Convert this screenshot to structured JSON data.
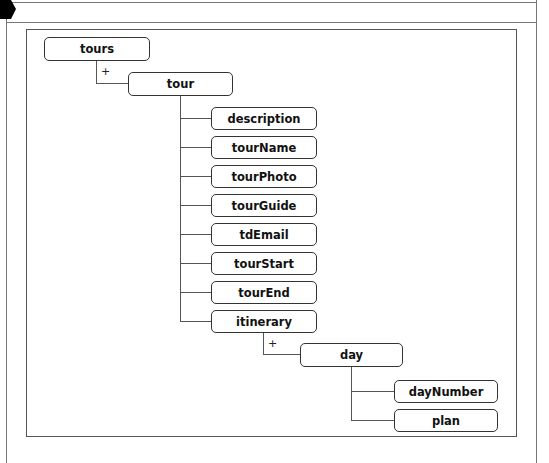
{
  "diagram": {
    "type": "xml-schema-tree",
    "root": {
      "label": "tours",
      "multiplicity": "+",
      "child": {
        "label": "tour",
        "children": [
          {
            "label": "description"
          },
          {
            "label": "tourName"
          },
          {
            "label": "tourPhoto"
          },
          {
            "label": "tourGuide"
          },
          {
            "label": "tdEmail"
          },
          {
            "label": "tourStart"
          },
          {
            "label": "tourEnd"
          },
          {
            "label": "itinerary",
            "multiplicity": "+",
            "child": {
              "label": "day",
              "children": [
                {
                  "label": "dayNumber"
                },
                {
                  "label": "plan"
                }
              ]
            }
          }
        ]
      }
    }
  },
  "nodes": {
    "tours": "tours",
    "tour": "tour",
    "description": "description",
    "tourName": "tourName",
    "tourPhoto": "tourPhoto",
    "tourGuide": "tourGuide",
    "tdEmail": "tdEmail",
    "tourStart": "tourStart",
    "tourEnd": "tourEnd",
    "itinerary": "itinerary",
    "day": "day",
    "dayNumber": "dayNumber",
    "plan": "plan"
  },
  "markers": {
    "tours_tour": "+",
    "itinerary_day": "+"
  },
  "colors": {
    "line": "#555555",
    "frame": "#777777",
    "node_border": "#333333",
    "pointer": "#000000"
  }
}
